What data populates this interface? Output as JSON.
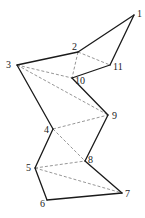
{
  "diagram": {
    "type": "polygon-triangulation",
    "vertices": [
      {
        "id": "1",
        "label": "1",
        "x": 134,
        "y": 15,
        "lx": 137,
        "ly": 17
      },
      {
        "id": "2",
        "label": "2",
        "x": 78,
        "y": 52,
        "lx": 72,
        "ly": 50
      },
      {
        "id": "3",
        "label": "3",
        "x": 17,
        "y": 65,
        "lx": 6,
        "ly": 68
      },
      {
        "id": "4",
        "label": "4",
        "x": 53,
        "y": 129,
        "lx": 44,
        "ly": 133
      },
      {
        "id": "5",
        "label": "5",
        "x": 35,
        "y": 168,
        "lx": 26,
        "ly": 171
      },
      {
        "id": "6",
        "label": "6",
        "x": 47,
        "y": 200,
        "lx": 40,
        "ly": 207
      },
      {
        "id": "7",
        "label": "7",
        "x": 122,
        "y": 193,
        "lx": 125,
        "ly": 197
      },
      {
        "id": "8",
        "label": "8",
        "x": 85,
        "y": 161,
        "lx": 88,
        "ly": 163
      },
      {
        "id": "9",
        "label": "9",
        "x": 108,
        "y": 115,
        "lx": 112,
        "ly": 119
      },
      {
        "id": "10",
        "label": "10",
        "x": 72,
        "y": 78,
        "lx": 75,
        "ly": 84
      },
      {
        "id": "11",
        "label": "11",
        "x": 110,
        "y": 65,
        "lx": 113,
        "ly": 70
      }
    ],
    "edges": [
      [
        "1",
        "2"
      ],
      [
        "2",
        "3"
      ],
      [
        "3",
        "4"
      ],
      [
        "4",
        "5"
      ],
      [
        "5",
        "6"
      ],
      [
        "6",
        "7"
      ],
      [
        "7",
        "8"
      ],
      [
        "8",
        "9"
      ],
      [
        "9",
        "10"
      ],
      [
        "10",
        "11"
      ],
      [
        "11",
        "1"
      ]
    ],
    "diagonals": [
      [
        "2",
        "10"
      ],
      [
        "2",
        "11"
      ],
      [
        "3",
        "10"
      ],
      [
        "3",
        "9"
      ],
      [
        "4",
        "9"
      ],
      [
        "4",
        "8"
      ],
      [
        "5",
        "8"
      ],
      [
        "5",
        "7"
      ]
    ],
    "colors": {
      "edge": "#1a1a1a",
      "diagonal": "#8a8a8a",
      "background": "#ffffff"
    }
  }
}
